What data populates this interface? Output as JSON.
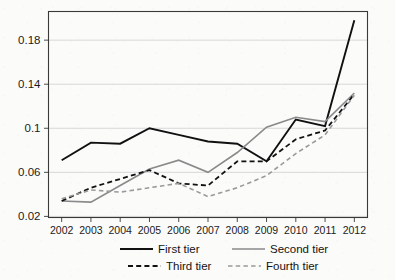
{
  "chart_data": {
    "type": "line",
    "title": "",
    "xlabel": "",
    "ylabel": "",
    "categories": [
      2002,
      2003,
      2004,
      2005,
      2006,
      2007,
      2008,
      2009,
      2010,
      2011,
      2012
    ],
    "x_tick_labels": [
      "2002",
      "2003",
      "2004",
      "2005",
      "2006",
      "2007",
      "2008",
      "2009",
      "2010",
      "2011",
      "2012"
    ],
    "y_tick_labels": [
      "0.02",
      "0.06",
      "0.1",
      "0.14",
      "0.18"
    ],
    "y_ticks": [
      0.02,
      0.06,
      0.1,
      0.14,
      0.18
    ],
    "ylim": [
      0.019,
      0.206
    ],
    "xlim": [
      2001.55,
      2012.45
    ],
    "grid": "horizontal",
    "legend_position": "bottom",
    "series": [
      {
        "name": "First tier",
        "style": "solid",
        "color": "#111111",
        "width": 1.9,
        "values": [
          0.071,
          0.087,
          0.086,
          0.1,
          0.094,
          0.088,
          0.086,
          0.07,
          0.108,
          0.102,
          0.198
        ]
      },
      {
        "name": "Second tier",
        "style": "solid",
        "color": "#8a8a8a",
        "width": 1.6,
        "values": [
          0.034,
          0.033,
          0.048,
          0.063,
          0.071,
          0.06,
          0.078,
          0.101,
          0.11,
          0.106,
          0.132
        ]
      },
      {
        "name": "Third tier",
        "style": "dashed",
        "color": "#111111",
        "width": 1.8,
        "values": [
          0.034,
          0.046,
          0.054,
          0.062,
          0.05,
          0.048,
          0.07,
          0.07,
          0.09,
          0.098,
          0.131
        ]
      },
      {
        "name": "Fourth tier",
        "style": "dashed",
        "color": "#9a9a9a",
        "width": 1.6,
        "values": [
          0.036,
          0.044,
          0.042,
          0.046,
          0.05,
          0.038,
          0.046,
          0.057,
          0.077,
          0.094,
          0.13
        ]
      }
    ]
  },
  "legend": {
    "entries": [
      {
        "label": "First tier"
      },
      {
        "label": "Second tier"
      },
      {
        "label": "Third tier"
      },
      {
        "label": "Fourth tier"
      }
    ]
  },
  "colors": {
    "background": "#fbfbfa",
    "axis": "#3a3a3a",
    "grid": "#c8c8c8",
    "dark_series": "#111111",
    "light_series": "#8a8a8a"
  }
}
